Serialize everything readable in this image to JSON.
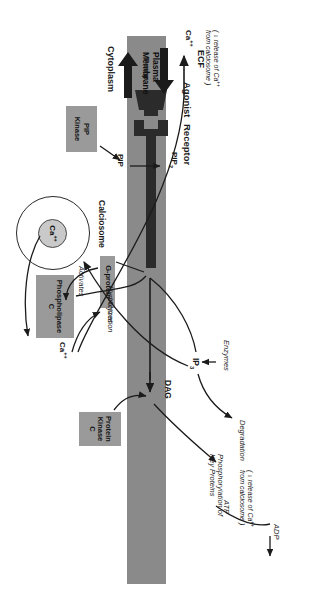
{
  "figure": {
    "type": "signal-transduction-diagram",
    "orientation_note": "landscape diagram rendered rotated 90 degrees on a portrait page"
  },
  "compartments": {
    "ecf": "ECF",
    "membrane": "Plasma\nMembrane",
    "membrane_line1": "Plasma",
    "membrane_line2": "Membrane",
    "cytoplasm": "Cytoplasm"
  },
  "membrane_features": {
    "pump_label": "Pump",
    "receptor_label": "Receptor",
    "agonist_label": "Agonist"
  },
  "lipids": {
    "pip": "PIP",
    "pip2": "PIP",
    "pip2_sub": "2",
    "dag": "DAG",
    "ip3": "IP",
    "ip3_sub": "3"
  },
  "enzyme_boxes": [
    {
      "name": "pip-kinase-box",
      "lines": [
        "PIP",
        "Kinase"
      ]
    },
    {
      "name": "g-protein-box",
      "lines": [
        "G-protein"
      ]
    },
    {
      "name": "phospholipase-c-box",
      "lines": [
        "Phospholipase",
        "C"
      ]
    },
    {
      "name": "protein-kinase-c-box",
      "lines": [
        "Protein",
        "Kinase",
        "C"
      ]
    }
  ],
  "process_labels": {
    "activates": "Activates",
    "hydrolyzes": "Hydrolyzes",
    "activation": "Activation",
    "enzymes": "Enzymes",
    "degradation": "Degradation",
    "phosphorylation": "Phosphorylation of\nKey Proteins",
    "phosphorylation_line1": "Phosphorylation of",
    "phosphorylation_line2": "Key Proteins",
    "atp": "ATP",
    "adp": "ADP"
  },
  "calcium": {
    "ion": "Ca",
    "ion_sup": "++",
    "calciosome": "Calciosome",
    "calciosome_ion": "Ca",
    "calciosome_ion_sup": "++",
    "efflux_note_line1": "( ↓ release of Ca",
    "efflux_note_line1_sup": "++",
    "efflux_note_line2": "from calciosome )",
    "degradation_note_line1": "( ↓ release of Ca",
    "degradation_note_line1_sup": "++",
    "degradation_note_line2": "from calciosome )"
  },
  "colors": {
    "membrane_gray": "#8a8a8a",
    "box_gray": "#9a9a9a",
    "calciosome_fill": "#c9c9c9",
    "ink": "#1b1b1b",
    "background": "#ffffff"
  }
}
